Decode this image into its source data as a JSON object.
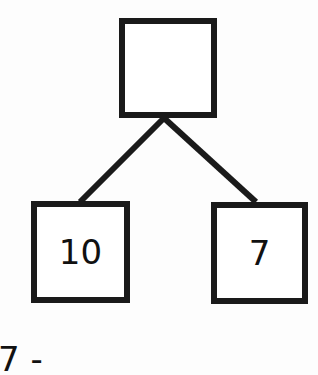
{
  "diagram": {
    "type": "number-bond",
    "top_node": {
      "value": ""
    },
    "left_node": {
      "value": "10"
    },
    "right_node": {
      "value": "7"
    },
    "bottom_partial_text": "7 -"
  }
}
